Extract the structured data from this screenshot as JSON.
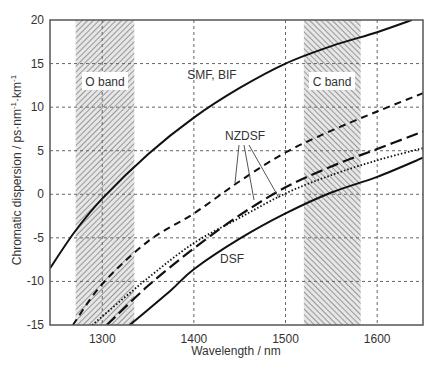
{
  "chart_data": {
    "type": "line",
    "title": "",
    "xlabel": "Wavelength / nm",
    "ylabel": "Chromatic dispersion  / ps·nm⁻¹·km⁻¹",
    "xlim": [
      1243,
      1650
    ],
    "ylim": [
      -15,
      20
    ],
    "xticks": [
      1300,
      1400,
      1500,
      1600
    ],
    "yticks": [
      -15,
      -10,
      -5,
      0,
      5,
      10,
      15,
      20
    ],
    "grid": true,
    "legend": "none (inline labels)",
    "bands": [
      {
        "name": "O band",
        "range": [
          1271,
          1335
        ]
      },
      {
        "name": "C band",
        "range": [
          1520,
          1582
        ]
      }
    ],
    "series": [
      {
        "name": "SMF, BIF",
        "style": "solid",
        "x": [
          1243,
          1270,
          1300,
          1350,
          1400,
          1450,
          1500,
          1550,
          1600,
          1638
        ],
        "y": [
          -8.5,
          -4.3,
          -0.5,
          4.6,
          8.8,
          12.2,
          15.0,
          17.0,
          18.6,
          20.0
        ]
      },
      {
        "name": "NZDSF (short dash)",
        "style": "short-dash",
        "x": [
          1268,
          1300,
          1350,
          1400,
          1450,
          1500,
          1550,
          1600,
          1650
        ],
        "y": [
          -15,
          -10.3,
          -5.4,
          -2.2,
          1.5,
          4.8,
          7.3,
          9.5,
          11.6
        ]
      },
      {
        "name": "NZDSF (long dash)",
        "style": "long-dash",
        "x": [
          1305,
          1350,
          1400,
          1450,
          1500,
          1550,
          1600,
          1650
        ],
        "y": [
          -15,
          -10.5,
          -6.2,
          -2.4,
          0.8,
          3.2,
          5.2,
          7.2
        ]
      },
      {
        "name": "NZDSF (dotted)",
        "style": "dotted",
        "x": [
          1289,
          1350,
          1400,
          1450,
          1500,
          1550,
          1600,
          1650
        ],
        "y": [
          -15,
          -9.6,
          -5.6,
          -2.7,
          0.1,
          2.2,
          3.9,
          5.3
        ]
      },
      {
        "name": "DSF",
        "style": "solid",
        "x": [
          1330,
          1375,
          1400,
          1450,
          1500,
          1550,
          1600,
          1650
        ],
        "y": [
          -15,
          -11.0,
          -8.6,
          -5.1,
          -2.2,
          0.2,
          2.0,
          4.2
        ]
      }
    ],
    "annotations": [
      {
        "text": "SMF, BIF",
        "x": 1420,
        "y": 13.2
      },
      {
        "text": "NZDSF",
        "x": 1438,
        "y": 6.8
      },
      {
        "text": "DSF",
        "x": 1422,
        "y": -7.5
      },
      {
        "text": "O band",
        "x": 1303,
        "y": 12.3
      },
      {
        "text": "C band",
        "x": 1551,
        "y": 12.3
      }
    ]
  },
  "labels": {
    "smf": "SMF, BIF",
    "nzdsf": "NZDSF",
    "dsf": "DSF",
    "oband": "O band",
    "cband": "C band",
    "xlabel": "Wavelength / nm",
    "ylabel_main": "Chromatic dispersion  / ps·nm",
    "ylabel_sup1": "-1",
    "ylabel_mid": "·km",
    "ylabel_sup2": "-1"
  },
  "ticks": {
    "x": [
      "1300",
      "1400",
      "1500",
      "1600"
    ],
    "y": [
      "20",
      "15",
      "10",
      "5",
      "0",
      "-5",
      "-10",
      "-15"
    ]
  }
}
